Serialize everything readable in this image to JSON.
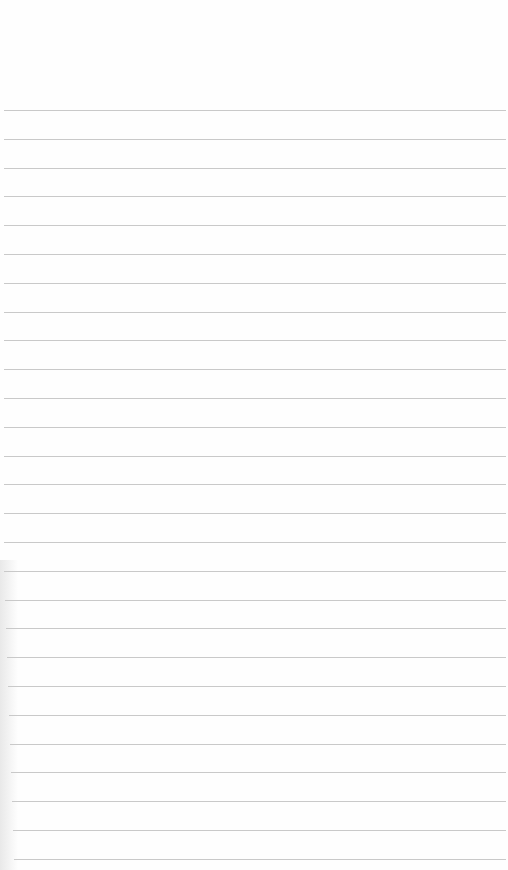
{
  "page": {
    "type": "lined-paper",
    "background_color": "#fefefe",
    "rule_color": "#c9c9c9",
    "first_rule_y": 110,
    "rule_spacing_px": 28.8,
    "rule_count": 27
  }
}
